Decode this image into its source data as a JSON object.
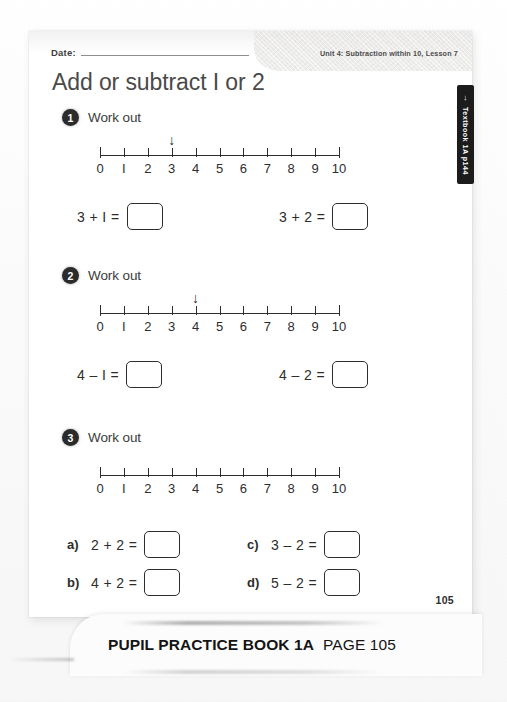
{
  "page": {
    "date_label": "Date:",
    "unit_header": "Unit 4: Subtraction within 10, Lesson 7",
    "title": "Add or subtract I or 2",
    "page_number": "105"
  },
  "side_tab": {
    "arrow": "→",
    "label": "Textbook 1A p144"
  },
  "caption": {
    "book": "PUPIL PRACTICE BOOK 1A",
    "page": "PAGE 105"
  },
  "number_line": {
    "labels": [
      "0",
      "I",
      "2",
      "3",
      "4",
      "5",
      "6",
      "7",
      "8",
      "9",
      "10"
    ],
    "min": 0,
    "max": 10
  },
  "questions": [
    {
      "number": "1",
      "instruction": "Work out",
      "arrow_at": 3,
      "has_arrow": true,
      "equations": [
        {
          "letter": "",
          "text": "3 + I ="
        },
        {
          "letter": "",
          "text": "3 + 2 ="
        }
      ]
    },
    {
      "number": "2",
      "instruction": "Work out",
      "arrow_at": 4,
      "has_arrow": true,
      "equations": [
        {
          "letter": "",
          "text": "4 – I ="
        },
        {
          "letter": "",
          "text": "4 – 2 ="
        }
      ]
    },
    {
      "number": "3",
      "instruction": "Work out",
      "arrow_at": null,
      "has_arrow": false,
      "equations": [
        {
          "letter": "a)",
          "text": "2 + 2 ="
        },
        {
          "letter": "c)",
          "text": "3 – 2 ="
        },
        {
          "letter": "b)",
          "text": "4 + 2 ="
        },
        {
          "letter": "d)",
          "text": "5 – 2 ="
        }
      ]
    }
  ],
  "colors": {
    "ink": "#2d2d2d",
    "title_ink": "#4a4a4a",
    "badge": "#2b2b2b",
    "tab": "#1c1c1c",
    "paper": "#ffffff"
  }
}
